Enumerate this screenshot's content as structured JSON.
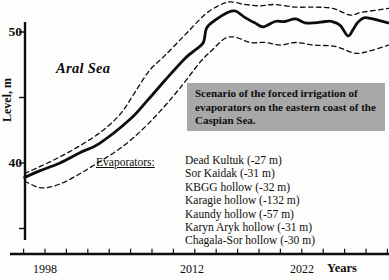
{
  "chart_data": {
    "type": "line",
    "xlabel": "Years",
    "ylabel": "Level, m",
    "x_axis": {
      "min_year": 1996,
      "max_year": 2030,
      "tick_step_years": 2,
      "labels": [
        "1998",
        "2012",
        "2022"
      ],
      "labeled_tick_years": [
        1998,
        2012,
        2022
      ]
    },
    "y_axis": {
      "min": 35,
      "max": 52.5,
      "tick_values": [
        35,
        40,
        45,
        50
      ],
      "labels": [
        "50",
        "40"
      ],
      "labeled_tick_values": [
        50,
        40
      ]
    },
    "grid": false,
    "legend": false,
    "series": [
      {
        "name": "Aral Sea level - scenario curve",
        "line_style": "solid",
        "points": [
          [
            1996.1,
            38.9
          ],
          [
            1997.5,
            39.4
          ],
          [
            1999.4,
            40.0
          ],
          [
            2001.3,
            40.8
          ],
          [
            2003.1,
            41.5
          ],
          [
            2005.9,
            43.3
          ],
          [
            2007.6,
            44.8
          ],
          [
            2009.2,
            46.3
          ],
          [
            2011.1,
            48.0
          ],
          [
            2012.0,
            48.6
          ],
          [
            2012.8,
            49.2
          ],
          [
            2013.1,
            50.3
          ],
          [
            2013.9,
            50.9
          ],
          [
            2015.1,
            51.5
          ],
          [
            2015.8,
            51.6
          ],
          [
            2016.7,
            51.1
          ],
          [
            2017.6,
            50.7
          ],
          [
            2018.4,
            50.4
          ],
          [
            2019.5,
            50.8
          ],
          [
            2020.4,
            50.8
          ],
          [
            2021.4,
            51.0
          ],
          [
            2022.3,
            50.7
          ],
          [
            2023.2,
            50.7
          ],
          [
            2024.2,
            50.8
          ],
          [
            2024.8,
            50.8
          ],
          [
            2025.6,
            50.5
          ],
          [
            2026.3,
            49.7
          ],
          [
            2026.8,
            50.2
          ],
          [
            2027.2,
            50.7
          ],
          [
            2027.9,
            51.1
          ],
          [
            2029.1,
            50.9
          ],
          [
            2030.1,
            50.7
          ]
        ]
      },
      {
        "name": "upper dashed bound",
        "line_style": "dashed",
        "points": [
          [
            1996.1,
            39.2
          ],
          [
            1998.5,
            40.1
          ],
          [
            2000.8,
            41.1
          ],
          [
            2003.1,
            42.3
          ],
          [
            2005.0,
            43.7
          ],
          [
            2006.4,
            45.4
          ],
          [
            2007.8,
            47.1
          ],
          [
            2009.2,
            48.2
          ],
          [
            2011.1,
            49.8
          ],
          [
            2012.9,
            51.3
          ],
          [
            2014.2,
            52.0
          ],
          [
            2015.3,
            52.3
          ],
          [
            2016.7,
            52.1
          ],
          [
            2018.1,
            52.0
          ],
          [
            2019.5,
            52.1
          ],
          [
            2021.4,
            51.9
          ],
          [
            2023.2,
            51.9
          ],
          [
            2024.9,
            51.8
          ],
          [
            2026.5,
            51.3
          ],
          [
            2027.6,
            51.5
          ],
          [
            2030.1,
            51.8
          ]
        ]
      },
      {
        "name": "lower dashed bound",
        "line_style": "dashed",
        "points": [
          [
            1996.1,
            38.6
          ],
          [
            1997.7,
            38.1
          ],
          [
            1999.4,
            38.4
          ],
          [
            2001.3,
            39.2
          ],
          [
            2003.1,
            40.1
          ],
          [
            2005.0,
            41.1
          ],
          [
            2006.9,
            42.4
          ],
          [
            2008.7,
            43.9
          ],
          [
            2010.6,
            45.7
          ],
          [
            2012.5,
            47.7
          ],
          [
            2013.6,
            48.6
          ],
          [
            2014.8,
            49.5
          ],
          [
            2015.8,
            49.6
          ],
          [
            2017.2,
            49.2
          ],
          [
            2018.6,
            49.2
          ],
          [
            2020.0,
            49.0
          ],
          [
            2021.4,
            49.2
          ],
          [
            2023.2,
            49.0
          ],
          [
            2025.1,
            48.9
          ],
          [
            2026.9,
            48.4
          ],
          [
            2028.1,
            48.5
          ],
          [
            2030.1,
            49.0
          ]
        ]
      }
    ],
    "annotations": {
      "region_label": "Aral Sea"
    }
  },
  "scenario_box": {
    "text": "Scenario of the forced irrigation of evaporators on the eastern coast of the Caspian Sea.",
    "bg_color": "#a8a8a8"
  },
  "evaporators": {
    "heading": "Evaporators:",
    "items": [
      "Dead Kultuk (-27 m)",
      "Sor Kaidak (-31 m)",
      "KBGG hollow (-32 m)",
      "Karagie hollow (-132 m)",
      "Kaundy hollow (-57 m)",
      "Karyn Aryk hollow (-31 m)",
      "Chagala-Sor hollow (-30 m)"
    ]
  },
  "colors": {
    "line": "#0d0d0d",
    "box_bg": "#a8a8a8",
    "background": "#fdfdfc"
  }
}
